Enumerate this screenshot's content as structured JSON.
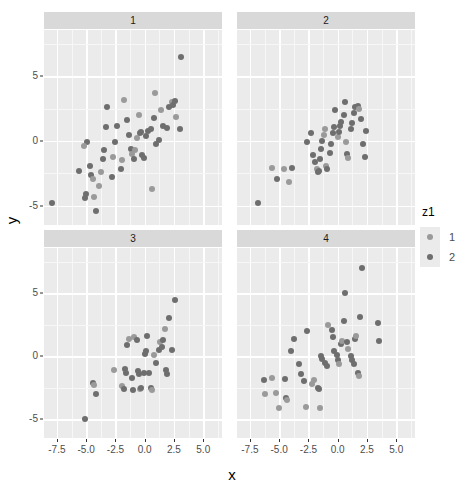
{
  "chart_data": {
    "type": "scatter",
    "title": "",
    "xlabel": "x",
    "ylabel": "y",
    "grid": true,
    "legend_position": "right",
    "legend": {
      "title": "z1",
      "entries": [
        {
          "label": "1",
          "color": "#9a9a9a"
        },
        {
          "label": "2",
          "color": "#6e6e6e"
        }
      ]
    },
    "facet": {
      "variable": "",
      "nrow": 2,
      "ncol": 2,
      "labels": [
        "1",
        "2",
        "3",
        "4"
      ]
    },
    "xlim": [
      -8.6,
      6.6
    ],
    "ylim": [
      -6.5,
      8.6
    ],
    "xticks": [
      -7.5,
      -5.0,
      -2.5,
      0.0,
      2.5,
      5.0
    ],
    "xtick_labels": [
      "-7.5",
      "-5.0",
      "-2.5",
      "0.0",
      "2.5",
      "5.0"
    ],
    "yticks": [
      -5,
      0,
      5
    ],
    "ytick_labels": [
      "-5",
      "0",
      "5"
    ],
    "panels": [
      {
        "label": "1",
        "points": [
          {
            "x": -7.9,
            "y": -4.8,
            "g": 2
          },
          {
            "x": -5.6,
            "y": -2.3,
            "g": 2
          },
          {
            "x": -5.1,
            "y": -4.4,
            "g": 2
          },
          {
            "x": -5.0,
            "y": -4.1,
            "g": 2
          },
          {
            "x": -4.2,
            "y": -5.4,
            "g": 2
          },
          {
            "x": -4.3,
            "y": -4.3,
            "g": 1
          },
          {
            "x": -4.6,
            "y": -2.6,
            "g": 2
          },
          {
            "x": -4.4,
            "y": -2.9,
            "g": 1
          },
          {
            "x": -4.7,
            "y": -1.9,
            "g": 2
          },
          {
            "x": -4.9,
            "y": -0.1,
            "g": 2
          },
          {
            "x": -5.2,
            "y": -0.4,
            "g": 1
          },
          {
            "x": -3.9,
            "y": -3.5,
            "g": 1
          },
          {
            "x": -3.7,
            "y": -2.4,
            "g": 1
          },
          {
            "x": -3.6,
            "y": -1.4,
            "g": 2
          },
          {
            "x": -3.5,
            "y": -0.7,
            "g": 2
          },
          {
            "x": -3.3,
            "y": 1.1,
            "g": 2
          },
          {
            "x": -3.2,
            "y": 2.6,
            "g": 2
          },
          {
            "x": -2.8,
            "y": -2.8,
            "g": 2
          },
          {
            "x": -2.7,
            "y": -1.2,
            "g": 1
          },
          {
            "x": -2.5,
            "y": -0.1,
            "g": 2
          },
          {
            "x": -2.4,
            "y": 1.2,
            "g": 2
          },
          {
            "x": -2.0,
            "y": -2.2,
            "g": 2
          },
          {
            "x": -1.9,
            "y": -1.5,
            "g": 1
          },
          {
            "x": -1.8,
            "y": 3.2,
            "g": 1
          },
          {
            "x": -1.5,
            "y": 1.6,
            "g": 2
          },
          {
            "x": -1.3,
            "y": 0.5,
            "g": 2
          },
          {
            "x": -1.2,
            "y": -0.6,
            "g": 2
          },
          {
            "x": -1.1,
            "y": -1.0,
            "g": 1
          },
          {
            "x": -0.9,
            "y": -1.4,
            "g": 2
          },
          {
            "x": -0.8,
            "y": -0.7,
            "g": 1
          },
          {
            "x": -0.7,
            "y": 0.2,
            "g": 1
          },
          {
            "x": -0.5,
            "y": 2.0,
            "g": 1
          },
          {
            "x": -0.4,
            "y": 0.6,
            "g": 2
          },
          {
            "x": -0.3,
            "y": 0.7,
            "g": 2
          },
          {
            "x": -0.2,
            "y": -1.1,
            "g": 2
          },
          {
            "x": -0.1,
            "y": -1.3,
            "g": 2
          },
          {
            "x": 0.1,
            "y": 0.4,
            "g": 2
          },
          {
            "x": 0.3,
            "y": 0.8,
            "g": 2
          },
          {
            "x": 0.5,
            "y": 0.9,
            "g": 2
          },
          {
            "x": 0.6,
            "y": -3.7,
            "g": 1
          },
          {
            "x": 0.8,
            "y": 1.8,
            "g": 2
          },
          {
            "x": 0.9,
            "y": 3.7,
            "g": 1
          },
          {
            "x": 1.0,
            "y": -0.2,
            "g": 2
          },
          {
            "x": 1.2,
            "y": 0.1,
            "g": 2
          },
          {
            "x": 1.4,
            "y": 2.4,
            "g": 1
          },
          {
            "x": 1.6,
            "y": 1.2,
            "g": 2
          },
          {
            "x": 1.9,
            "y": 1.0,
            "g": 2
          },
          {
            "x": 2.1,
            "y": 2.6,
            "g": 2
          },
          {
            "x": 2.3,
            "y": 3.0,
            "g": 1
          },
          {
            "x": 2.4,
            "y": 2.8,
            "g": 2
          },
          {
            "x": 2.6,
            "y": 3.1,
            "g": 2
          },
          {
            "x": 2.7,
            "y": 1.9,
            "g": 1
          },
          {
            "x": 3.0,
            "y": 0.9,
            "g": 2
          },
          {
            "x": 3.1,
            "y": 6.5,
            "g": 2
          }
        ]
      },
      {
        "label": "2",
        "points": [
          {
            "x": -6.8,
            "y": -4.8,
            "g": 2
          },
          {
            "x": -5.6,
            "y": -2.1,
            "g": 1
          },
          {
            "x": -5.2,
            "y": -2.9,
            "g": 2
          },
          {
            "x": -4.6,
            "y": -2.2,
            "g": 1
          },
          {
            "x": -4.2,
            "y": -3.2,
            "g": 1
          },
          {
            "x": -3.9,
            "y": -2.1,
            "g": 2
          },
          {
            "x": -2.6,
            "y": -0.1,
            "g": 2
          },
          {
            "x": -2.3,
            "y": 0.6,
            "g": 2
          },
          {
            "x": -2.1,
            "y": -1.1,
            "g": 2
          },
          {
            "x": -1.9,
            "y": -1.6,
            "g": 2
          },
          {
            "x": -1.8,
            "y": -2.2,
            "g": 1
          },
          {
            "x": -1.7,
            "y": -2.4,
            "g": 2
          },
          {
            "x": -1.6,
            "y": -2.3,
            "g": 2
          },
          {
            "x": -1.5,
            "y": -1.4,
            "g": 2
          },
          {
            "x": -1.4,
            "y": -0.6,
            "g": 2
          },
          {
            "x": -1.3,
            "y": 0.0,
            "g": 2
          },
          {
            "x": -1.2,
            "y": 0.5,
            "g": 1
          },
          {
            "x": -1.1,
            "y": 0.9,
            "g": 1
          },
          {
            "x": -1.0,
            "y": -1.9,
            "g": 1
          },
          {
            "x": -0.9,
            "y": -2.2,
            "g": 2
          },
          {
            "x": -0.7,
            "y": -0.9,
            "g": 2
          },
          {
            "x": -0.6,
            "y": -0.2,
            "g": 2
          },
          {
            "x": -0.4,
            "y": 0.6,
            "g": 2
          },
          {
            "x": -0.3,
            "y": 1.1,
            "g": 2
          },
          {
            "x": -0.2,
            "y": 2.4,
            "g": 2
          },
          {
            "x": 0.0,
            "y": 0.3,
            "g": 1
          },
          {
            "x": 0.1,
            "y": 0.7,
            "g": 2
          },
          {
            "x": 0.2,
            "y": 1.2,
            "g": 2
          },
          {
            "x": 0.3,
            "y": 1.5,
            "g": 2
          },
          {
            "x": 0.5,
            "y": 2.0,
            "g": 2
          },
          {
            "x": 0.6,
            "y": 3.0,
            "g": 2
          },
          {
            "x": 0.7,
            "y": -0.1,
            "g": 1
          },
          {
            "x": 0.8,
            "y": -1.0,
            "g": 2
          },
          {
            "x": 0.9,
            "y": -1.3,
            "g": 1
          },
          {
            "x": 1.1,
            "y": 0.9,
            "g": 2
          },
          {
            "x": 1.2,
            "y": 1.4,
            "g": 2
          },
          {
            "x": 1.4,
            "y": 2.2,
            "g": 2
          },
          {
            "x": 1.5,
            "y": 2.6,
            "g": 2
          },
          {
            "x": 1.7,
            "y": 2.7,
            "g": 2
          },
          {
            "x": 1.8,
            "y": 2.5,
            "g": 1
          },
          {
            "x": 2.0,
            "y": 1.7,
            "g": 2
          },
          {
            "x": 2.2,
            "y": -0.2,
            "g": 2
          },
          {
            "x": 2.3,
            "y": -1.2,
            "g": 2
          },
          {
            "x": 2.4,
            "y": 0.8,
            "g": 2
          }
        ]
      },
      {
        "label": "3",
        "points": [
          {
            "x": -5.1,
            "y": -5.0,
            "g": 2
          },
          {
            "x": -4.4,
            "y": -2.1,
            "g": 2
          },
          {
            "x": -4.3,
            "y": -2.3,
            "g": 1
          },
          {
            "x": -4.2,
            "y": -3.0,
            "g": 2
          },
          {
            "x": -2.6,
            "y": -1.1,
            "g": 1
          },
          {
            "x": -1.9,
            "y": -2.4,
            "g": 1
          },
          {
            "x": -1.8,
            "y": -2.6,
            "g": 2
          },
          {
            "x": -1.7,
            "y": -1.0,
            "g": 2
          },
          {
            "x": -1.6,
            "y": -1.3,
            "g": 2
          },
          {
            "x": -1.5,
            "y": 0.9,
            "g": 2
          },
          {
            "x": -1.3,
            "y": 1.4,
            "g": 1
          },
          {
            "x": -1.1,
            "y": -1.7,
            "g": 2
          },
          {
            "x": -1.0,
            "y": -2.7,
            "g": 2
          },
          {
            "x": -0.9,
            "y": 1.5,
            "g": 1
          },
          {
            "x": -0.7,
            "y": 1.3,
            "g": 2
          },
          {
            "x": -0.6,
            "y": -1.2,
            "g": 2
          },
          {
            "x": -0.5,
            "y": -1.4,
            "g": 2
          },
          {
            "x": -0.4,
            "y": -2.6,
            "g": 1
          },
          {
            "x": -0.3,
            "y": -2.5,
            "g": 2
          },
          {
            "x": -0.1,
            "y": -1.3,
            "g": 2
          },
          {
            "x": 0.0,
            "y": 0.2,
            "g": 2
          },
          {
            "x": 0.1,
            "y": 0.4,
            "g": 2
          },
          {
            "x": 0.2,
            "y": 1.6,
            "g": 2
          },
          {
            "x": 0.4,
            "y": -1.3,
            "g": 2
          },
          {
            "x": 0.5,
            "y": -2.5,
            "g": 2
          },
          {
            "x": 0.6,
            "y": -2.7,
            "g": 1
          },
          {
            "x": 0.8,
            "y": 0.1,
            "g": 1
          },
          {
            "x": 1.0,
            "y": -0.5,
            "g": 2
          },
          {
            "x": 1.2,
            "y": 0.5,
            "g": 2
          },
          {
            "x": 1.3,
            "y": 1.1,
            "g": 1
          },
          {
            "x": 1.5,
            "y": 0.7,
            "g": 2
          },
          {
            "x": 1.6,
            "y": 1.3,
            "g": 2
          },
          {
            "x": 1.7,
            "y": 2.2,
            "g": 1
          },
          {
            "x": 1.8,
            "y": -1.1,
            "g": 2
          },
          {
            "x": 1.9,
            "y": -1.4,
            "g": 2
          },
          {
            "x": 2.1,
            "y": 3.0,
            "g": 2
          },
          {
            "x": 2.3,
            "y": 0.5,
            "g": 2
          },
          {
            "x": 2.6,
            "y": 4.5,
            "g": 2
          }
        ]
      },
      {
        "label": "4",
        "points": [
          {
            "x": -6.3,
            "y": -1.9,
            "g": 2
          },
          {
            "x": -6.2,
            "y": -3.0,
            "g": 1
          },
          {
            "x": -5.6,
            "y": -1.7,
            "g": 1
          },
          {
            "x": -5.3,
            "y": -2.9,
            "g": 1
          },
          {
            "x": -5.0,
            "y": -4.1,
            "g": 1
          },
          {
            "x": -4.5,
            "y": -1.8,
            "g": 2
          },
          {
            "x": -4.4,
            "y": -3.3,
            "g": 2
          },
          {
            "x": -4.3,
            "y": -3.5,
            "g": 1
          },
          {
            "x": -4.0,
            "y": 0.4,
            "g": 2
          },
          {
            "x": -3.7,
            "y": 1.4,
            "g": 2
          },
          {
            "x": -3.3,
            "y": -0.6,
            "g": 2
          },
          {
            "x": -3.1,
            "y": -1.4,
            "g": 2
          },
          {
            "x": -2.9,
            "y": -2.0,
            "g": 2
          },
          {
            "x": -2.7,
            "y": -4.0,
            "g": 1
          },
          {
            "x": -2.6,
            "y": 2.0,
            "g": 2
          },
          {
            "x": -2.2,
            "y": -2.2,
            "g": 1
          },
          {
            "x": -2.0,
            "y": -1.9,
            "g": 1
          },
          {
            "x": -1.7,
            "y": -2.5,
            "g": 2
          },
          {
            "x": -1.6,
            "y": -2.6,
            "g": 2
          },
          {
            "x": -1.5,
            "y": -4.1,
            "g": 1
          },
          {
            "x": -1.4,
            "y": 0.0,
            "g": 2
          },
          {
            "x": -1.3,
            "y": -0.2,
            "g": 2
          },
          {
            "x": -1.1,
            "y": -0.5,
            "g": 2
          },
          {
            "x": -0.9,
            "y": -0.8,
            "g": 2
          },
          {
            "x": -0.8,
            "y": 2.5,
            "g": 1
          },
          {
            "x": -0.5,
            "y": 2.1,
            "g": 2
          },
          {
            "x": -0.4,
            "y": 1.5,
            "g": 2
          },
          {
            "x": -0.3,
            "y": 0.4,
            "g": 2
          },
          {
            "x": -0.1,
            "y": 0.1,
            "g": 2
          },
          {
            "x": 0.0,
            "y": -0.3,
            "g": 2
          },
          {
            "x": 0.1,
            "y": -0.6,
            "g": 1
          },
          {
            "x": 0.3,
            "y": 1.0,
            "g": 2
          },
          {
            "x": 0.4,
            "y": 1.2,
            "g": 1
          },
          {
            "x": 0.5,
            "y": 2.8,
            "g": 2
          },
          {
            "x": 0.6,
            "y": 5.0,
            "g": 2
          },
          {
            "x": 0.8,
            "y": 1.1,
            "g": 2
          },
          {
            "x": 0.9,
            "y": 0.6,
            "g": 1
          },
          {
            "x": 1.1,
            "y": 0.0,
            "g": 2
          },
          {
            "x": 1.2,
            "y": -0.3,
            "g": 2
          },
          {
            "x": 1.4,
            "y": -0.6,
            "g": 2
          },
          {
            "x": 1.5,
            "y": 1.4,
            "g": 2
          },
          {
            "x": 1.6,
            "y": 1.6,
            "g": 1
          },
          {
            "x": 1.7,
            "y": -1.3,
            "g": 2
          },
          {
            "x": 1.8,
            "y": -1.6,
            "g": 1
          },
          {
            "x": 1.9,
            "y": 3.1,
            "g": 2
          },
          {
            "x": 2.1,
            "y": 7.0,
            "g": 2
          },
          {
            "x": 3.4,
            "y": 2.6,
            "g": 2
          },
          {
            "x": 3.5,
            "y": 1.2,
            "g": 2
          }
        ]
      }
    ]
  },
  "theme": {
    "panel_fill": "#ebebeb",
    "strip_fill": "#d9d9d9",
    "grid_major": "#ffffff",
    "grid_minor": "#f7f7f7",
    "background": "#ffffff",
    "axis_text": "#4d4d4d",
    "axis_title": "#000000"
  }
}
